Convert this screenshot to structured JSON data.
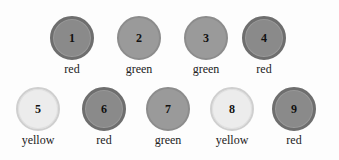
{
  "items": [
    {
      "number": "1",
      "label": "red",
      "color": "red"
    },
    {
      "number": "2",
      "label": "green",
      "color": "green"
    },
    {
      "number": "3",
      "label": "green",
      "color": "green"
    },
    {
      "number": "4",
      "label": "red",
      "color": "red"
    },
    {
      "number": "5",
      "label": "yellow",
      "color": "yellow"
    },
    {
      "number": "6",
      "label": "red",
      "color": "red"
    },
    {
      "number": "7",
      "label": "green",
      "color": "green"
    },
    {
      "number": "8",
      "label": "yellow",
      "color": "yellow"
    },
    {
      "number": "9",
      "label": "red",
      "color": "red"
    }
  ]
}
